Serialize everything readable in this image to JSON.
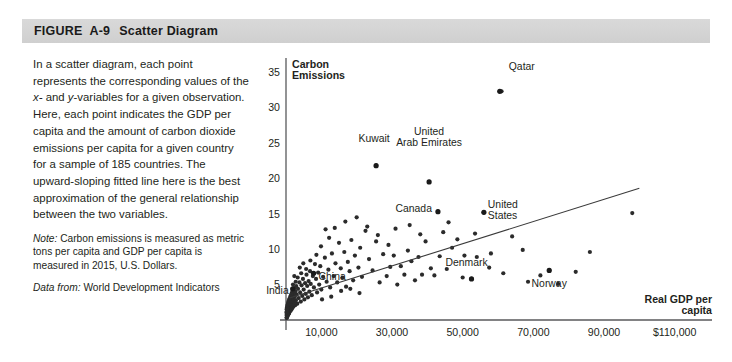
{
  "figure": {
    "label": "FIGURE",
    "number": "A-9",
    "name": "Scatter Diagram"
  },
  "caption": {
    "body_part1": "In a scatter diagram, each point represents the corresponding values of the ",
    "body_italic_x": "x-",
    "body_part2": " and ",
    "body_italic_y": "y",
    "body_part3": "-variables for a given observation. Here, each point indicates the GDP per capita and the amount of carbon dioxide emissions per capita for a given country for a sample of 185 countries. The upward-sloping fitted line here is the best approximation of the general relationship between the two variables.",
    "note_label": "Note:",
    "note_text": " Carbon emissions is measured as metric tons per capita and GDP per capita is measured in 2015, U.S. Dollars.",
    "source_label": "Data from:",
    "source_text": " World Development Indicators"
  },
  "chart_data": {
    "type": "scatter",
    "title": "",
    "ylabel": "Carbon Emissions",
    "xlabel": "Real GDP per capita",
    "xlabel_line1": "Real GDP per",
    "xlabel_line2": "capita",
    "ylabel_line1": "Carbon",
    "ylabel_line2": "Emissions",
    "grid": false,
    "legend": "none",
    "xlim": [
      0,
      120000
    ],
    "ylim": [
      0,
      37
    ],
    "xticks": [
      10000,
      30000,
      50000,
      70000,
      90000,
      110000
    ],
    "xticklabels": [
      "10,000",
      "30,000",
      "50,000",
      "70,000",
      "90,000",
      "$110,000"
    ],
    "yticks": [
      5,
      10,
      15,
      20,
      25,
      30,
      35
    ],
    "yticklabels": [
      "5",
      "10",
      "15",
      "20",
      "25",
      "30",
      "35"
    ],
    "fitted_line": {
      "label": "upward-sloping fitted line",
      "x0": 1000,
      "y0": 3.1,
      "x1": 100000,
      "y1": 18.6
    },
    "annotations": [
      {
        "name": "Qatar",
        "x": 60500,
        "y": 32.3,
        "label_dx": 9,
        "label_dy": 3.5,
        "anchor": "start"
      },
      {
        "name": "Kuwait",
        "x": 25500,
        "y": 21.8,
        "label_dx": -2,
        "label_dy": 3.9,
        "anchor": "middle"
      },
      {
        "name": "United Arab Emirates",
        "x": 40500,
        "y": 19.5,
        "label_dx": 0,
        "label_dy": 6.6,
        "anchor": "middle",
        "two_line": true,
        "line1": "United",
        "line2": "Arab Emirates"
      },
      {
        "name": "Canada",
        "x": 43000,
        "y": 15.3,
        "label_dx": -6,
        "label_dy": 0.4,
        "anchor": "end"
      },
      {
        "name": "United States",
        "x": 56000,
        "y": 15.2,
        "label_dx": 4,
        "label_dy": 0.6,
        "anchor": "start",
        "two_line": true,
        "line1": "United",
        "line2": "States"
      },
      {
        "name": "Denmark",
        "x": 52500,
        "y": 5.8,
        "label_dx": -5,
        "label_dy": 2.4,
        "anchor": "middle"
      },
      {
        "name": "Norway",
        "x": 74500,
        "y": 7.0,
        "label_dx": 0,
        "label_dy": -1.9,
        "anchor": "middle"
      },
      {
        "name": "China",
        "x": 7800,
        "y": 6.6,
        "label_dx": 5,
        "label_dy": -0.4,
        "anchor": "start"
      },
      {
        "name": "India",
        "x": 1900,
        "y": 4.4,
        "label_dx": -4,
        "label_dy": -0.2,
        "anchor": "end"
      }
    ],
    "points": [
      [
        61000,
        32.3
      ],
      [
        25500,
        21.8
      ],
      [
        40500,
        19.5
      ],
      [
        43000,
        15.3
      ],
      [
        56000,
        15.2
      ],
      [
        52500,
        5.8
      ],
      [
        74500,
        7.0
      ],
      [
        7800,
        6.6
      ],
      [
        1900,
        4.4
      ],
      [
        98000,
        15.1
      ],
      [
        72000,
        6.3
      ],
      [
        86000,
        9.6
      ],
      [
        67000,
        9.9
      ],
      [
        64000,
        11.8
      ],
      [
        58000,
        9.4
      ],
      [
        54000,
        8.9
      ],
      [
        50000,
        6.0
      ],
      [
        50500,
        9.1
      ],
      [
        47000,
        10.2
      ],
      [
        45500,
        7.2
      ],
      [
        44500,
        12.4
      ],
      [
        43500,
        9.0
      ],
      [
        42000,
        6.3
      ],
      [
        41000,
        7.3
      ],
      [
        39500,
        11.1
      ],
      [
        38500,
        6.4
      ],
      [
        37500,
        8.9
      ],
      [
        36500,
        5.6
      ],
      [
        35500,
        8.3
      ],
      [
        34500,
        9.8
      ],
      [
        33500,
        6.4
      ],
      [
        32500,
        7.6
      ],
      [
        31500,
        5.0
      ],
      [
        30500,
        9.1
      ],
      [
        29500,
        7.5
      ],
      [
        28500,
        6.2
      ],
      [
        27500,
        9.3
      ],
      [
        26500,
        5.3
      ],
      [
        25500,
        11.1
      ],
      [
        24500,
        7.0
      ],
      [
        23500,
        8.6
      ],
      [
        22500,
        12.6
      ],
      [
        21500,
        6.1
      ],
      [
        21000,
        10.2
      ],
      [
        20500,
        7.4
      ],
      [
        19500,
        9.1
      ],
      [
        19000,
        5.6
      ],
      [
        18500,
        11.3
      ],
      [
        18000,
        6.9
      ],
      [
        17500,
        8.2
      ],
      [
        17000,
        4.7
      ],
      [
        16500,
        9.6
      ],
      [
        16000,
        6.0
      ],
      [
        15500,
        7.3
      ],
      [
        15000,
        10.9
      ],
      [
        14500,
        5.3
      ],
      [
        14000,
        8.0
      ],
      [
        13500,
        6.2
      ],
      [
        13000,
        9.4
      ],
      [
        12500,
        4.6
      ],
      [
        12000,
        7.1
      ],
      [
        11500,
        5.4
      ],
      [
        11000,
        8.8
      ],
      [
        10500,
        6.1
      ],
      [
        10000,
        4.3
      ],
      [
        9700,
        7.6
      ],
      [
        9400,
        5.0
      ],
      [
        9100,
        6.7
      ],
      [
        8800,
        3.9
      ],
      [
        8500,
        5.8
      ],
      [
        8200,
        7.9
      ],
      [
        7900,
        4.6
      ],
      [
        7600,
        6.2
      ],
      [
        7300,
        3.5
      ],
      [
        7000,
        5.1
      ],
      [
        6800,
        6.9
      ],
      [
        6600,
        4.0
      ],
      [
        6400,
        5.5
      ],
      [
        6200,
        3.2
      ],
      [
        6000,
        4.8
      ],
      [
        5800,
        6.4
      ],
      [
        5600,
        3.7
      ],
      [
        5400,
        5.2
      ],
      [
        5200,
        2.9
      ],
      [
        5000,
        4.3
      ],
      [
        4800,
        5.8
      ],
      [
        4600,
        3.4
      ],
      [
        4400,
        4.9
      ],
      [
        4200,
        2.6
      ],
      [
        4000,
        3.9
      ],
      [
        3800,
        5.3
      ],
      [
        3600,
        3.1
      ],
      [
        3400,
        4.4
      ],
      [
        3200,
        2.3
      ],
      [
        3000,
        3.6
      ],
      [
        2900,
        4.8
      ],
      [
        2800,
        2.8
      ],
      [
        2700,
        4.0
      ],
      [
        2600,
        2.1
      ],
      [
        2500,
        3.3
      ],
      [
        2400,
        4.5
      ],
      [
        2300,
        2.5
      ],
      [
        2200,
        3.7
      ],
      [
        2100,
        1.9
      ],
      [
        2000,
        3.0
      ],
      [
        1950,
        4.2
      ],
      [
        1900,
        2.3
      ],
      [
        1850,
        3.4
      ],
      [
        1800,
        1.7
      ],
      [
        1750,
        2.8
      ],
      [
        1700,
        3.9
      ],
      [
        1650,
        2.1
      ],
      [
        1600,
        3.2
      ],
      [
        1550,
        1.5
      ],
      [
        1500,
        2.6
      ],
      [
        1450,
        3.6
      ],
      [
        1400,
        1.9
      ],
      [
        1350,
        2.9
      ],
      [
        1300,
        1.3
      ],
      [
        1250,
        2.4
      ],
      [
        1200,
        3.3
      ],
      [
        1150,
        1.7
      ],
      [
        1100,
        2.7
      ],
      [
        1050,
        1.2
      ],
      [
        1000,
        2.2
      ],
      [
        980,
        3.0
      ],
      [
        950,
        1.5
      ],
      [
        920,
        2.5
      ],
      [
        900,
        1.0
      ],
      [
        880,
        2.0
      ],
      [
        850,
        2.8
      ],
      [
        820,
        1.4
      ],
      [
        800,
        2.3
      ],
      [
        780,
        0.9
      ],
      [
        750,
        1.8
      ],
      [
        720,
        2.6
      ],
      [
        700,
        1.3
      ],
      [
        680,
        2.1
      ],
      [
        650,
        0.8
      ],
      [
        620,
        1.6
      ],
      [
        600,
        2.4
      ],
      [
        580,
        1.1
      ],
      [
        560,
        1.9
      ],
      [
        540,
        0.7
      ],
      [
        520,
        1.4
      ],
      [
        500,
        2.2
      ],
      [
        480,
        1.0
      ],
      [
        460,
        1.7
      ],
      [
        440,
        0.6
      ],
      [
        420,
        1.2
      ],
      [
        400,
        2.0
      ],
      [
        380,
        0.9
      ],
      [
        360,
        1.5
      ],
      [
        340,
        0.5
      ],
      [
        320,
        1.1
      ],
      [
        300,
        1.8
      ],
      [
        290,
        0.8
      ],
      [
        280,
        1.4
      ],
      [
        270,
        0.4
      ],
      [
        260,
        1.0
      ],
      [
        250,
        1.6
      ],
      [
        240,
        0.7
      ],
      [
        230,
        1.2
      ],
      [
        220,
        0.35
      ],
      [
        210,
        0.9
      ],
      [
        200,
        1.5
      ],
      [
        195,
        0.6
      ],
      [
        190,
        1.1
      ],
      [
        185,
        0.3
      ],
      [
        13800,
        13.0
      ],
      [
        16800,
        13.9
      ],
      [
        12200,
        11.6
      ],
      [
        11200,
        12.8
      ],
      [
        9900,
        10.4
      ],
      [
        20000,
        14.5
      ],
      [
        23000,
        13.2
      ],
      [
        26000,
        12.0
      ],
      [
        29000,
        10.6
      ],
      [
        31000,
        12.9
      ],
      [
        35000,
        13.4
      ],
      [
        38000,
        12.1
      ],
      [
        46000,
        13.8
      ],
      [
        48500,
        11.4
      ],
      [
        53500,
        12.2
      ],
      [
        57500,
        7.4
      ],
      [
        61500,
        6.6
      ],
      [
        68500,
        5.4
      ],
      [
        77000,
        5.1
      ],
      [
        82000,
        6.8
      ],
      [
        8600,
        9.2
      ],
      [
        6900,
        8.4
      ],
      [
        5700,
        7.2
      ],
      [
        4900,
        8.0
      ],
      [
        4300,
        6.6
      ],
      [
        3900,
        7.4
      ],
      [
        3300,
        6.0
      ],
      [
        2750,
        5.4
      ],
      [
        2350,
        6.2
      ],
      [
        1980,
        5.0
      ],
      [
        15600,
        4.1
      ],
      [
        18200,
        4.4
      ],
      [
        20800,
        3.8
      ],
      [
        12800,
        3.3
      ],
      [
        10200,
        2.9
      ]
    ]
  }
}
